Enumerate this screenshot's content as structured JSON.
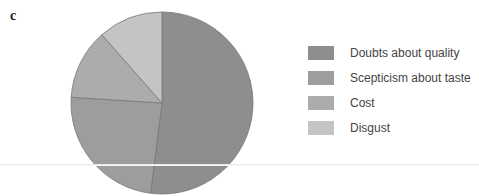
{
  "panel_label": "c",
  "chart_data": {
    "type": "pie",
    "title": "",
    "categories": [
      "Doubts about quality",
      "Scepticism about taste",
      "Cost",
      "Disgust"
    ],
    "values": [
      52,
      24,
      12.5,
      11.5
    ],
    "colors": [
      "#8e8e8e",
      "#9d9d9d",
      "#acacac",
      "#c4c4c4"
    ],
    "legend_position": "right",
    "start_angle": "12 o'clock, clockwise"
  },
  "legend": {
    "items": [
      {
        "label": "Doubts about quality",
        "color": "#8e8e8e"
      },
      {
        "label": "Scepticism about taste",
        "color": "#9d9d9d"
      },
      {
        "label": "Cost",
        "color": "#acacac"
      },
      {
        "label": "Disgust",
        "color": "#c4c4c4"
      }
    ]
  }
}
